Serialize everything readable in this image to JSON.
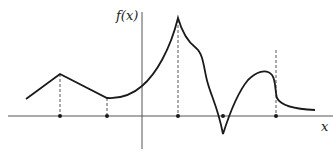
{
  "figure": {
    "y_axis_label": "f(x)",
    "x_axis_label": "x",
    "colors": {
      "curve": "#1a1a1a",
      "axis": "#555555",
      "dashed": "#555555",
      "dot": "#1a1a1a",
      "background": "#ffffff"
    },
    "marked_points_x": [
      60,
      107,
      178,
      223,
      276
    ],
    "features": [
      "corner maximum",
      "corner minimum",
      "cusp maximum",
      "cusp minimum",
      "jump discontinuity"
    ]
  }
}
